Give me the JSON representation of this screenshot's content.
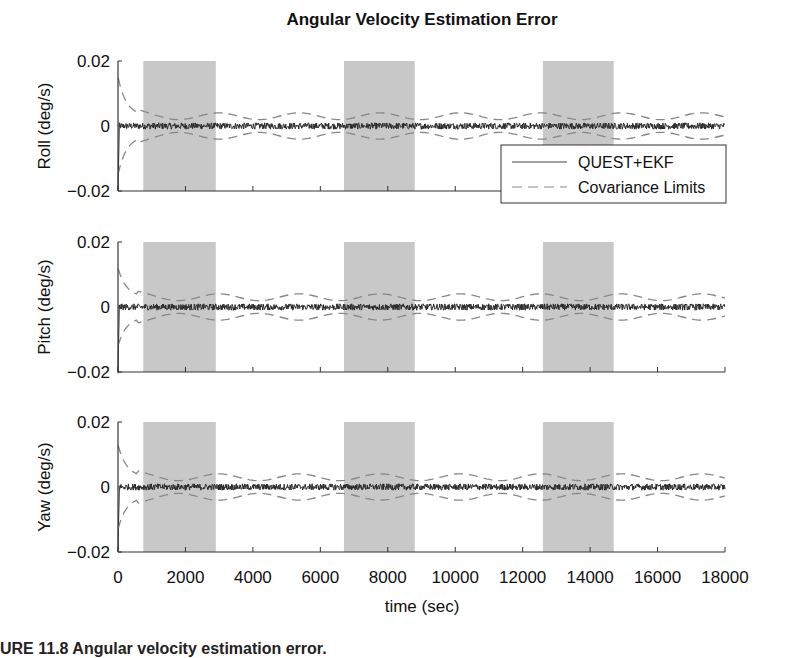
{
  "chart_data": {
    "type": "line",
    "title": "Angular Velocity Estimation Error",
    "xlabel": "time (sec)",
    "xlim": [
      0,
      18000
    ],
    "xticks": [
      0,
      2000,
      4000,
      6000,
      8000,
      10000,
      12000,
      14000,
      16000,
      18000
    ],
    "xtick_labels": [
      "0",
      "2000",
      "4000",
      "6000",
      "8000",
      "10000",
      "12000",
      "14000",
      "16000",
      "18000"
    ],
    "shaded_intervals": [
      [
        750,
        2900
      ],
      [
        6700,
        8800
      ],
      [
        12600,
        14700
      ]
    ],
    "legend": {
      "placement": "bottom-right of first panel",
      "entries": [
        {
          "label": "QUEST+EKF",
          "style": "solid"
        },
        {
          "label": "Covariance Limits",
          "style": "dashed"
        }
      ]
    },
    "panels": [
      {
        "name": "roll",
        "ylabel": "Roll (deg/s)",
        "ylim": [
          -0.02,
          0.02
        ],
        "yticks": [
          -0.02,
          0,
          0.02
        ],
        "ytick_labels": [
          "−0.02",
          "0",
          "0.02"
        ],
        "noise_amplitude": 0.001,
        "cov_initial": 0.015,
        "cov_steady": 0.003
      },
      {
        "name": "pitch",
        "ylabel": "Pitch (deg/s)",
        "ylim": [
          -0.02,
          0.02
        ],
        "yticks": [
          -0.02,
          0,
          0.02
        ],
        "ytick_labels": [
          "−0.02",
          "0",
          "0.02"
        ],
        "noise_amplitude": 0.001,
        "cov_initial": 0.012,
        "cov_steady": 0.003
      },
      {
        "name": "yaw",
        "ylabel": "Yaw (deg/s)",
        "ylim": [
          -0.02,
          0.02
        ],
        "yticks": [
          -0.02,
          0,
          0.02
        ],
        "ytick_labels": [
          "−0.02",
          "0",
          "0.02"
        ],
        "noise_amplitude": 0.001,
        "cov_initial": 0.013,
        "cov_steady": 0.003
      }
    ],
    "series": [
      {
        "name": "QUEST+EKF",
        "description": "estimation error noise centered at 0, approx ±0.001 deg/s"
      },
      {
        "name": "Covariance Limits",
        "description": "±3σ bounds converging from ~±0.015 to ~±0.003 deg/s"
      }
    ]
  },
  "caption": "URE 11.8   Angular velocity estimation error."
}
